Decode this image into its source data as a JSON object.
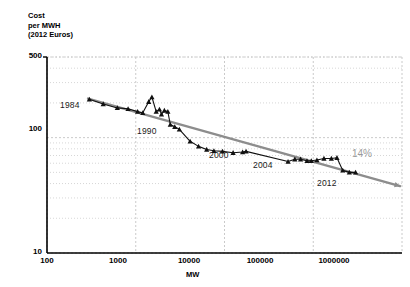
{
  "chart_data": {
    "type": "line",
    "title": "",
    "xlabel": "MW",
    "ylabel": "Cost per MWH (2012 Euros)",
    "ylabel_lines": [
      "Cost",
      "per MWH",
      "(2012 Euros)"
    ],
    "xscale": "log",
    "yscale": "log",
    "xlim": [
      100,
      1000000
    ],
    "ylim": [
      10,
      500
    ],
    "grid": true,
    "grid_style": "dotted minor and major log gridlines",
    "legend": "none",
    "xticks": [
      "100",
      "1000",
      "10000",
      "100000",
      "1000000"
    ],
    "xtick_values": [
      100,
      1000,
      10000,
      100000,
      1000000
    ],
    "yticks": [
      "500",
      "100",
      "10"
    ],
    "ytick_values": [
      500,
      100,
      10
    ],
    "series": [
      {
        "name": "Wind energy cost experience curve",
        "marker": "triangle",
        "color": "#111111",
        "points": [
          {
            "x": 300,
            "y": 215,
            "label": "1984"
          },
          {
            "x": 430,
            "y": 196
          },
          {
            "x": 620,
            "y": 181
          },
          {
            "x": 820,
            "y": 178
          },
          {
            "x": 1050,
            "y": 168
          },
          {
            "x": 1200,
            "y": 164
          },
          {
            "x": 1400,
            "y": 205
          },
          {
            "x": 1520,
            "y": 225
          },
          {
            "x": 1700,
            "y": 168
          },
          {
            "x": 1850,
            "y": 176
          },
          {
            "x": 1950,
            "y": 159
          },
          {
            "x": 2100,
            "y": 172
          },
          {
            "x": 2300,
            "y": 168
          },
          {
            "x": 2450,
            "y": 130,
            "label": "1990"
          },
          {
            "x": 2750,
            "y": 124
          },
          {
            "x": 3100,
            "y": 118
          },
          {
            "x": 4100,
            "y": 93
          },
          {
            "x": 5100,
            "y": 84
          },
          {
            "x": 6300,
            "y": 79
          },
          {
            "x": 7600,
            "y": 77
          },
          {
            "x": 9500,
            "y": 76
          },
          {
            "x": 12500,
            "y": 74
          },
          {
            "x": 16000,
            "y": 75
          },
          {
            "x": 17500,
            "y": 76
          },
          {
            "x": 52000,
            "y": 62,
            "label": "2000"
          },
          {
            "x": 62000,
            "y": 65
          },
          {
            "x": 72000,
            "y": 65
          },
          {
            "x": 85000,
            "y": 63
          },
          {
            "x": 95000,
            "y": 63,
            "label": "2004"
          },
          {
            "x": 110000,
            "y": 64
          },
          {
            "x": 132000,
            "y": 66
          },
          {
            "x": 160000,
            "y": 66
          },
          {
            "x": 185000,
            "y": 67
          },
          {
            "x": 215000,
            "y": 52
          },
          {
            "x": 255000,
            "y": 50
          },
          {
            "x": 300000,
            "y": 50,
            "label": "2012"
          }
        ]
      }
    ],
    "trendline": {
      "name": "14% learning rate",
      "label": "14%",
      "color": "#8d8d8d",
      "from": {
        "x": 290,
        "y": 218
      },
      "to": {
        "x": 950000,
        "y": 38
      },
      "arrow": true
    },
    "annotations": [
      {
        "text": "1984",
        "x": 300,
        "y": 215
      },
      {
        "text": "1990",
        "x": 2450,
        "y": 130
      },
      {
        "text": "2000",
        "x": 52000,
        "y": 62
      },
      {
        "text": "2004",
        "x": 95000,
        "y": 63
      },
      {
        "text": "2012",
        "x": 300000,
        "y": 50
      },
      {
        "text": "14%",
        "x": 500000,
        "y": 55
      }
    ]
  },
  "axes": {
    "y": {
      "lines": {
        "l1": "Cost",
        "l2": "per MWH",
        "l3": "(2012 Euros)"
      },
      "tick_500": "500",
      "tick_100": "100",
      "tick_10": "10"
    },
    "x": {
      "title": "MW",
      "tick_100": "100",
      "tick_1000": "1000",
      "tick_10000": "10000",
      "tick_100000": "100000",
      "tick_1000000": "1000000"
    }
  },
  "labels": {
    "y1984": "1984",
    "y1990": "1990",
    "y2000": "2000",
    "y2004": "2004",
    "y2012": "2012",
    "rate": "14%"
  },
  "colors": {
    "series": "#111111",
    "trendline": "#8d8d8d",
    "grid": "#bcbcbc",
    "axis": "#000000",
    "accent_text": "#9a9a9a"
  }
}
